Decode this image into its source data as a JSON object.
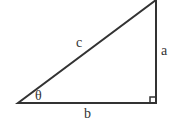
{
  "diagram": {
    "type": "right-triangle",
    "labels": {
      "hypotenuse": "c",
      "opposite": "a",
      "adjacent": "b",
      "angle": "θ"
    },
    "colors": {
      "stroke": "#333333",
      "background": "#ffffff"
    },
    "right_angle_marker": true
  }
}
